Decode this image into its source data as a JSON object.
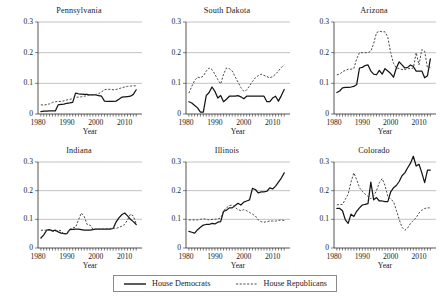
{
  "figure": {
    "axis_title_x": "Year",
    "y_ticks": [
      "0",
      "0.1",
      "0.2",
      "0.3"
    ],
    "x_ticks": [
      "1980",
      "1990",
      "2000",
      "2010"
    ]
  },
  "legend": {
    "entries": [
      {
        "label": "House Democrats",
        "style": "solid",
        "color": "#151515"
      },
      {
        "label": "House Republicans",
        "style": "dashed",
        "color": "#4a4a4a"
      }
    ]
  },
  "chart_data": {
    "type": "line",
    "title": "",
    "xlabel": "Year",
    "ylabel": "",
    "xlim": [
      1980,
      2016
    ],
    "ylim": [
      0,
      0.3
    ],
    "yticks": [
      0,
      0.1,
      0.2,
      0.3
    ],
    "xticks": [
      1980,
      1990,
      2000,
      2010
    ],
    "grid": true,
    "legend_position": "bottom-center",
    "panel_layout": [
      2,
      3
    ],
    "series_names": [
      "House Democrats",
      "House Republicans"
    ],
    "panels": [
      {
        "title": "Pennsylvania",
        "x": [
          1981,
          1982,
          1983,
          1984,
          1985,
          1986,
          1987,
          1988,
          1989,
          1990,
          1991,
          1992,
          1993,
          1994,
          1995,
          1996,
          1997,
          1998,
          1999,
          2000,
          2001,
          2002,
          2003,
          2004,
          2005,
          2006,
          2007,
          2008,
          2009,
          2010,
          2011,
          2012,
          2013,
          2014
        ],
        "series": [
          {
            "name": "House Democrats",
            "values": [
              0.008,
              0.009,
              0.009,
              0.01,
              0.01,
              0.01,
              0.03,
              0.031,
              0.032,
              0.035,
              0.036,
              0.038,
              0.068,
              0.066,
              0.065,
              0.064,
              0.064,
              0.062,
              0.062,
              0.062,
              0.06,
              0.058,
              0.042,
              0.041,
              0.041,
              0.041,
              0.042,
              0.048,
              0.055,
              0.056,
              0.057,
              0.058,
              0.064,
              0.079
            ]
          },
          {
            "name": "House Republicans",
            "values": [
              0.03,
              0.029,
              0.031,
              0.033,
              0.038,
              0.04,
              0.041,
              0.041,
              0.043,
              0.046,
              0.048,
              0.05,
              0.055,
              0.055,
              0.056,
              0.058,
              0.06,
              0.062,
              0.063,
              0.064,
              0.066,
              0.072,
              0.079,
              0.081,
              0.08,
              0.079,
              0.08,
              0.082,
              0.086,
              0.088,
              0.09,
              0.091,
              0.092,
              0.092
            ]
          }
        ]
      },
      {
        "title": "South Dakota",
        "x": [
          1981,
          1982,
          1983,
          1984,
          1985,
          1986,
          1987,
          1988,
          1989,
          1990,
          1991,
          1992,
          1993,
          1994,
          1995,
          1996,
          1997,
          1998,
          1999,
          2000,
          2001,
          2002,
          2003,
          2004,
          2005,
          2006,
          2007,
          2008,
          2009,
          2010,
          2011,
          2012,
          2013,
          2014
        ],
        "series": [
          {
            "name": "House Democrats",
            "values": [
              0.04,
              0.036,
              0.028,
              0.02,
              0.006,
              0.006,
              0.06,
              0.07,
              0.088,
              0.074,
              0.052,
              0.06,
              0.04,
              0.048,
              0.058,
              0.058,
              0.058,
              0.06,
              0.056,
              0.05,
              0.058,
              0.058,
              0.058,
              0.058,
              0.058,
              0.058,
              0.058,
              0.04,
              0.04,
              0.052,
              0.058,
              0.042,
              0.06,
              0.08
            ]
          },
          {
            "name": "House Republicans",
            "values": [
              0.068,
              0.09,
              0.11,
              0.12,
              0.118,
              0.124,
              0.14,
              0.15,
              0.145,
              0.13,
              0.112,
              0.098,
              0.13,
              0.15,
              0.148,
              0.14,
              0.122,
              0.104,
              0.086,
              0.074,
              0.078,
              0.092,
              0.106,
              0.118,
              0.125,
              0.13,
              0.126,
              0.122,
              0.118,
              0.122,
              0.13,
              0.14,
              0.152,
              0.16
            ]
          }
        ]
      },
      {
        "title": "Arizona",
        "x": [
          1981,
          1982,
          1983,
          1984,
          1985,
          1986,
          1987,
          1988,
          1989,
          1990,
          1991,
          1992,
          1993,
          1994,
          1995,
          1996,
          1997,
          1998,
          1999,
          2000,
          2001,
          2002,
          2003,
          2004,
          2005,
          2006,
          2007,
          2008,
          2009,
          2010,
          2011,
          2012,
          2013,
          2014
        ],
        "series": [
          {
            "name": "House Democrats",
            "values": [
              0.07,
              0.075,
              0.085,
              0.087,
              0.087,
              0.088,
              0.09,
              0.096,
              0.15,
              0.152,
              0.158,
              0.16,
              0.14,
              0.13,
              0.128,
              0.142,
              0.13,
              0.148,
              0.14,
              0.132,
              0.12,
              0.15,
              0.17,
              0.16,
              0.15,
              0.152,
              0.16,
              0.155,
              0.14,
              0.14,
              0.14,
              0.118,
              0.125,
              0.18
            ]
          },
          {
            "name": "House Republicans",
            "values": [
              0.128,
              0.13,
              0.138,
              0.142,
              0.146,
              0.146,
              0.148,
              0.18,
              0.2,
              0.2,
              0.2,
              0.2,
              0.205,
              0.23,
              0.265,
              0.27,
              0.268,
              0.268,
              0.25,
              0.2,
              0.165,
              0.15,
              0.148,
              0.145,
              0.145,
              0.148,
              0.148,
              0.15,
              0.2,
              0.16,
              0.21,
              0.205,
              0.15,
              0.152
            ]
          }
        ]
      },
      {
        "title": "Indiana",
        "x": [
          1981,
          1982,
          1983,
          1984,
          1985,
          1986,
          1987,
          1988,
          1989,
          1990,
          1991,
          1992,
          1993,
          1994,
          1995,
          1996,
          1997,
          1998,
          1999,
          2000,
          2001,
          2002,
          2003,
          2004,
          2005,
          2006,
          2007,
          2008,
          2009,
          2010,
          2011,
          2012,
          2013,
          2014
        ],
        "series": [
          {
            "name": "House Democrats",
            "values": [
              0.035,
              0.046,
              0.062,
              0.064,
              0.06,
              0.062,
              0.056,
              0.052,
              0.05,
              0.05,
              0.064,
              0.065,
              0.066,
              0.066,
              0.064,
              0.062,
              0.062,
              0.062,
              0.064,
              0.066,
              0.066,
              0.066,
              0.066,
              0.066,
              0.066,
              0.068,
              0.09,
              0.105,
              0.116,
              0.122,
              0.112,
              0.1,
              0.092,
              0.082
            ]
          },
          {
            "name": "House Republicans",
            "values": [
              0.062,
              0.062,
              0.062,
              0.062,
              0.058,
              0.058,
              0.062,
              0.06,
              0.048,
              0.05,
              0.066,
              0.07,
              0.072,
              0.098,
              0.122,
              0.11,
              0.082,
              0.08,
              0.066,
              0.066,
              0.066,
              0.066,
              0.066,
              0.068,
              0.068,
              0.07,
              0.068,
              0.072,
              0.076,
              0.082,
              0.098,
              0.118,
              0.112,
              0.084
            ]
          }
        ]
      },
      {
        "title": "Illinois",
        "x": [
          1981,
          1982,
          1983,
          1984,
          1985,
          1986,
          1987,
          1988,
          1989,
          1990,
          1991,
          1992,
          1993,
          1994,
          1995,
          1996,
          1997,
          1998,
          1999,
          2000,
          2001,
          2002,
          2003,
          2004,
          2005,
          2006,
          2007,
          2008,
          2009,
          2010,
          2011,
          2012,
          2013,
          2014
        ],
        "series": [
          {
            "name": "House Democrats",
            "values": [
              0.058,
              0.055,
              0.052,
              0.064,
              0.072,
              0.08,
              0.082,
              0.082,
              0.086,
              0.084,
              0.09,
              0.092,
              0.128,
              0.132,
              0.14,
              0.14,
              0.148,
              0.156,
              0.15,
              0.16,
              0.164,
              0.168,
              0.208,
              0.204,
              0.192,
              0.196,
              0.196,
              0.198,
              0.21,
              0.206,
              0.216,
              0.23,
              0.244,
              0.262
            ]
          },
          {
            "name": "House Republicans",
            "values": [
              0.098,
              0.098,
              0.098,
              0.098,
              0.1,
              0.102,
              0.1,
              0.098,
              0.1,
              0.1,
              0.102,
              0.104,
              0.13,
              0.14,
              0.148,
              0.15,
              0.142,
              0.134,
              0.13,
              0.134,
              0.13,
              0.124,
              0.118,
              0.112,
              0.098,
              0.092,
              0.09,
              0.092,
              0.094,
              0.094,
              0.094,
              0.096,
              0.098,
              0.096
            ]
          }
        ]
      },
      {
        "title": "Colorado",
        "x": [
          1981,
          1982,
          1983,
          1984,
          1985,
          1986,
          1987,
          1988,
          1989,
          1990,
          1991,
          1992,
          1993,
          1994,
          1995,
          1996,
          1997,
          1998,
          1999,
          2000,
          2001,
          2002,
          2003,
          2004,
          2005,
          2006,
          2007,
          2008,
          2009,
          2010,
          2011,
          2012,
          2013,
          2014
        ],
        "series": [
          {
            "name": "House Democrats",
            "values": [
              0.138,
              0.138,
              0.13,
              0.098,
              0.086,
              0.118,
              0.11,
              0.128,
              0.14,
              0.15,
              0.152,
              0.155,
              0.23,
              0.168,
              0.176,
              0.164,
              0.164,
              0.162,
              0.162,
              0.196,
              0.21,
              0.218,
              0.232,
              0.252,
              0.262,
              0.28,
              0.296,
              0.32,
              0.286,
              0.292,
              0.262,
              0.228,
              0.272,
              0.272
            ]
          },
          {
            "name": "House Republicans",
            "values": [
              0.15,
              0.152,
              0.152,
              0.17,
              0.188,
              0.23,
              0.262,
              0.238,
              0.21,
              0.198,
              0.188,
              0.18,
              0.172,
              0.182,
              0.2,
              0.228,
              0.242,
              0.218,
              0.18,
              0.17,
              0.162,
              0.132,
              0.1,
              0.072,
              0.062,
              0.07,
              0.086,
              0.096,
              0.106,
              0.122,
              0.132,
              0.138,
              0.14,
              0.14
            ]
          }
        ]
      }
    ]
  }
}
